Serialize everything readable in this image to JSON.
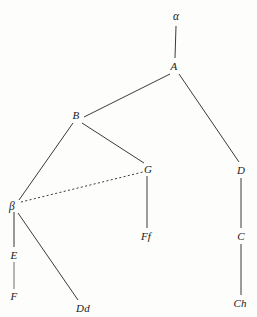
{
  "diagram": {
    "type": "tree-graph",
    "width": 257,
    "height": 317,
    "background_color": "#fdfdfb",
    "line_color": "#3a3a3a",
    "accent_line_color": "#6e6e6e",
    "text_color": "#1b1b1b"
  },
  "nodes": [
    {
      "id": "alpha",
      "label": "α",
      "x": 176,
      "y": 17,
      "greek": true
    },
    {
      "id": "A",
      "label": "A",
      "x": 174,
      "y": 66,
      "greek": false
    },
    {
      "id": "B",
      "label": "B",
      "x": 76,
      "y": 115,
      "greek": false
    },
    {
      "id": "G",
      "label": "G",
      "x": 148,
      "y": 169,
      "greek": false
    },
    {
      "id": "D",
      "label": "D",
      "x": 241,
      "y": 170,
      "greek": false
    },
    {
      "id": "beta",
      "label": "β",
      "x": 12,
      "y": 207,
      "greek": true
    },
    {
      "id": "Ff",
      "label": "Ff",
      "x": 146,
      "y": 236,
      "greek": false
    },
    {
      "id": "C",
      "label": "C",
      "x": 241,
      "y": 236,
      "greek": false
    },
    {
      "id": "E",
      "label": "E",
      "x": 14,
      "y": 255,
      "greek": false
    },
    {
      "id": "F",
      "label": "F",
      "x": 14,
      "y": 296,
      "greek": false
    },
    {
      "id": "Dd",
      "label": "Dd",
      "x": 83,
      "y": 308,
      "greek": false
    },
    {
      "id": "Ch",
      "label": "Ch",
      "x": 240,
      "y": 303,
      "greek": false
    }
  ],
  "edges": [
    {
      "id": "alpha-A",
      "from": "alpha",
      "to": "A",
      "style": "solid",
      "x1": 176,
      "y1": 26,
      "x2": 175,
      "y2": 58,
      "width": 1,
      "color": "#3a3a3a"
    },
    {
      "id": "A-B",
      "from": "A",
      "to": "B",
      "style": "solid",
      "x1": 170,
      "y1": 74,
      "x2": 84,
      "y2": 117,
      "width": 1,
      "color": "#3a3a3a"
    },
    {
      "id": "A-D",
      "from": "A",
      "to": "D",
      "style": "solid",
      "x1": 179,
      "y1": 74,
      "x2": 239,
      "y2": 162,
      "width": 1,
      "color": "#3a3a3a"
    },
    {
      "id": "B-beta",
      "from": "B",
      "to": "beta",
      "style": "solid",
      "x1": 73,
      "y1": 123,
      "x2": 19,
      "y2": 200,
      "width": 1,
      "color": "#3a3a3a"
    },
    {
      "id": "B-G",
      "from": "B",
      "to": "G",
      "style": "solid",
      "x1": 82,
      "y1": 123,
      "x2": 144,
      "y2": 163,
      "width": 1,
      "color": "#3a3a3a"
    },
    {
      "id": "beta-G",
      "from": "beta",
      "to": "G",
      "style": "dotted",
      "x1": 21,
      "y1": 202,
      "x2": 143,
      "y2": 172,
      "width": 1,
      "color": "#3a3a3a"
    },
    {
      "id": "G-Ff",
      "from": "G",
      "to": "Ff",
      "style": "solid",
      "x1": 147,
      "y1": 176,
      "x2": 147,
      "y2": 228,
      "width": 1,
      "color": "#3a3a3a"
    },
    {
      "id": "D-C",
      "from": "D",
      "to": "C",
      "style": "solid",
      "x1": 241,
      "y1": 178,
      "x2": 241,
      "y2": 228,
      "width": 1,
      "color": "#3a3a3a"
    },
    {
      "id": "C-Ch",
      "from": "C",
      "to": "Ch",
      "style": "solid",
      "x1": 241,
      "y1": 244,
      "x2": 241,
      "y2": 295,
      "width": 1,
      "color": "#3a3a3a"
    },
    {
      "id": "beta-E",
      "from": "beta",
      "to": "E",
      "style": "solid",
      "x1": 14,
      "y1": 212,
      "x2": 14,
      "y2": 247,
      "width": 1.4,
      "color": "#6e6e6e"
    },
    {
      "id": "E-F",
      "from": "E",
      "to": "F",
      "style": "solid",
      "x1": 14,
      "y1": 262,
      "x2": 14,
      "y2": 289,
      "width": 1,
      "color": "#6e6e6e"
    },
    {
      "id": "beta-Dd",
      "from": "beta",
      "to": "Dd",
      "style": "solid",
      "x1": 18,
      "y1": 213,
      "x2": 78,
      "y2": 300,
      "width": 1,
      "color": "#3a3a3a"
    }
  ]
}
